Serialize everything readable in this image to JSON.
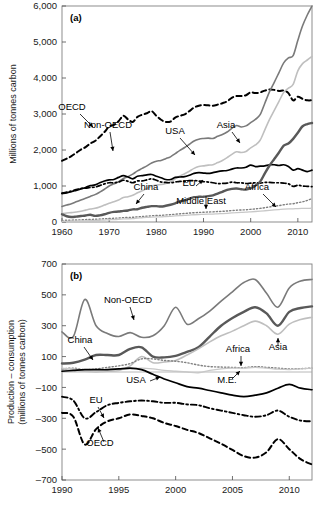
{
  "figure": {
    "panels": [
      "a",
      "b"
    ]
  },
  "chart_data": [
    {
      "id": "panel-a",
      "type": "line",
      "panel_tag": "(a)",
      "title": "",
      "xlabel": "",
      "ylabel": "Millions of tonnes carbon",
      "xlim": [
        1960,
        2013
      ],
      "ylim": [
        0,
        6000
      ],
      "xticks": [
        1960,
        1970,
        1980,
        1990,
        2000,
        2010
      ],
      "yticks": [
        0,
        1000,
        2000,
        3000,
        4000,
        5000,
        6000
      ],
      "ytick_labels": [
        "0",
        "1,000",
        "2,000",
        "3,000",
        "4,000",
        "5,000",
        "6,000"
      ],
      "xtick_labels": [
        "1960",
        "1970",
        "1980",
        "1990",
        "2000",
        "2010"
      ],
      "grid": false,
      "legend": "inline-annotations",
      "x": [
        1960,
        1961,
        1962,
        1963,
        1964,
        1965,
        1966,
        1967,
        1968,
        1969,
        1970,
        1971,
        1972,
        1973,
        1974,
        1975,
        1976,
        1977,
        1978,
        1979,
        1980,
        1981,
        1982,
        1983,
        1984,
        1985,
        1986,
        1987,
        1988,
        1989,
        1990,
        1991,
        1992,
        1993,
        1994,
        1995,
        1996,
        1997,
        1998,
        1999,
        2000,
        2001,
        2002,
        2003,
        2004,
        2005,
        2006,
        2007,
        2008,
        2009,
        2010,
        2011,
        2012,
        2013
      ],
      "series": [
        {
          "name": "OECD",
          "style": "dashed",
          "color": "#000000",
          "width": 2.0,
          "values": [
            1700,
            1760,
            1830,
            1920,
            2010,
            2080,
            2180,
            2250,
            2370,
            2500,
            2650,
            2700,
            2800,
            2950,
            2850,
            2780,
            2920,
            2980,
            3020,
            3080,
            2950,
            2840,
            2780,
            2790,
            2900,
            2950,
            2990,
            3080,
            3180,
            3230,
            3250,
            3240,
            3230,
            3260,
            3300,
            3350,
            3450,
            3500,
            3500,
            3520,
            3600,
            3580,
            3600,
            3650,
            3680,
            3670,
            3640,
            3650,
            3580,
            3380,
            3480,
            3420,
            3380,
            3380
          ]
        },
        {
          "name": "Non-OECD",
          "style": "solid",
          "color": "#7a7a7a",
          "width": 1.6,
          "values": [
            430,
            470,
            510,
            560,
            610,
            660,
            710,
            760,
            830,
            910,
            1000,
            1060,
            1120,
            1210,
            1260,
            1330,
            1420,
            1490,
            1560,
            1640,
            1690,
            1710,
            1760,
            1810,
            1900,
            1990,
            2070,
            2160,
            2250,
            2300,
            2320,
            2330,
            2320,
            2380,
            2430,
            2500,
            2600,
            2680,
            2640,
            2670,
            2760,
            2850,
            2980,
            3300,
            3620,
            3880,
            4150,
            4420,
            4560,
            4620,
            5050,
            5450,
            5750,
            6000
          ]
        },
        {
          "name": "Asia",
          "style": "solid",
          "color": "#bfbfbf",
          "width": 1.6,
          "values": [
            230,
            250,
            260,
            280,
            300,
            330,
            360,
            380,
            420,
            470,
            520,
            560,
            610,
            680,
            700,
            740,
            810,
            870,
            930,
            1000,
            1030,
            1040,
            1070,
            1120,
            1200,
            1280,
            1340,
            1410,
            1490,
            1540,
            1560,
            1580,
            1590,
            1650,
            1710,
            1790,
            1880,
            1950,
            1930,
            1960,
            2060,
            2140,
            2270,
            2560,
            2850,
            3100,
            3350,
            3600,
            3720,
            3820,
            4200,
            4400,
            4500,
            4600
          ]
        },
        {
          "name": "USA",
          "style": "solid",
          "color": "#000000",
          "width": 1.7,
          "values": [
            790,
            810,
            840,
            880,
            920,
            960,
            1010,
            1030,
            1090,
            1140,
            1170,
            1180,
            1240,
            1290,
            1250,
            1200,
            1270,
            1290,
            1310,
            1320,
            1270,
            1230,
            1180,
            1180,
            1240,
            1250,
            1260,
            1300,
            1350,
            1370,
            1360,
            1350,
            1370,
            1400,
            1420,
            1430,
            1470,
            1500,
            1500,
            1520,
            1580,
            1540,
            1550,
            1560,
            1590,
            1590,
            1570,
            1590,
            1540,
            1440,
            1480,
            1440,
            1400,
            1440
          ]
        },
        {
          "name": "EU",
          "style": "dashdot",
          "color": "#000000",
          "width": 1.7,
          "values": [
            800,
            830,
            860,
            900,
            930,
            940,
            960,
            970,
            1010,
            1060,
            1090,
            1090,
            1110,
            1160,
            1130,
            1090,
            1140,
            1140,
            1170,
            1200,
            1160,
            1110,
            1100,
            1090,
            1110,
            1130,
            1130,
            1150,
            1150,
            1140,
            1120,
            1110,
            1090,
            1070,
            1070,
            1080,
            1110,
            1090,
            1090,
            1070,
            1080,
            1090,
            1080,
            1100,
            1100,
            1090,
            1090,
            1080,
            1060,
            990,
            1020,
            1000,
            990,
            980
          ]
        },
        {
          "name": "China",
          "style": "solid",
          "color": "#595959",
          "width": 2.4,
          "values": [
            215,
            160,
            140,
            150,
            165,
            180,
            200,
            170,
            185,
            215,
            255,
            280,
            290,
            310,
            320,
            350,
            355,
            395,
            420,
            440,
            440,
            430,
            450,
            480,
            520,
            570,
            600,
            650,
            690,
            700,
            700,
            720,
            740,
            790,
            840,
            890,
            920,
            930,
            910,
            900,
            940,
            1010,
            1120,
            1350,
            1570,
            1750,
            1930,
            2120,
            2180,
            2310,
            2480,
            2660,
            2720,
            2750
          ]
        },
        {
          "name": "Africa",
          "style": "dotted",
          "color": "#808080",
          "width": 1.4,
          "values": [
            45,
            48,
            52,
            56,
            60,
            66,
            72,
            76,
            82,
            90,
            98,
            104,
            112,
            122,
            128,
            132,
            142,
            152,
            162,
            174,
            182,
            186,
            196,
            204,
            216,
            228,
            236,
            248,
            258,
            266,
            272,
            278,
            282,
            290,
            296,
            306,
            318,
            328,
            334,
            340,
            352,
            364,
            378,
            398,
            418,
            438,
            456,
            478,
            498,
            508,
            536,
            562,
            600,
            650
          ]
        },
        {
          "name": "Middle East",
          "style": "solid",
          "color": "#c8c8c8",
          "width": 1.3,
          "values": [
            18,
            20,
            22,
            26,
            30,
            34,
            38,
            42,
            48,
            54,
            62,
            68,
            76,
            86,
            90,
            96,
            108,
            118,
            126,
            134,
            140,
            142,
            150,
            158,
            168,
            176,
            182,
            192,
            202,
            208,
            212,
            216,
            220,
            228,
            234,
            242,
            252,
            260,
            266,
            272,
            282,
            292,
            302,
            312,
            324,
            336,
            346,
            356,
            362,
            366,
            374,
            378,
            380,
            382
          ]
        }
      ]
    },
    {
      "id": "panel-b",
      "type": "line",
      "panel_tag": "(b)",
      "title": "",
      "xlabel": "",
      "ylabel": "Production – consumption (millions of tonnes carbon)",
      "xlim": [
        1990,
        2012
      ],
      "ylim": [
        -700,
        700
      ],
      "xticks": [
        1990,
        1995,
        2000,
        2005,
        2010
      ],
      "yticks": [
        -700,
        -500,
        -300,
        -100,
        100,
        300,
        500,
        700
      ],
      "ytick_labels": [
        "–700",
        "–500",
        "–300",
        "–100",
        "100",
        "300",
        "500",
        "700"
      ],
      "xtick_labels": [
        "1990",
        "1995",
        "2000",
        "2005",
        "2010"
      ],
      "grid": false,
      "legend": "inline-annotations",
      "x": [
        1990,
        1991,
        1992,
        1993,
        1994,
        1995,
        1996,
        1997,
        1998,
        1999,
        2000,
        2001,
        2002,
        2003,
        2004,
        2005,
        2006,
        2007,
        2008,
        2009,
        2010,
        2011,
        2012
      ],
      "series": [
        {
          "name": "Non-OECD",
          "style": "solid",
          "color": "#7a7a7a",
          "width": 1.6,
          "values": [
            260,
            230,
            470,
            300,
            250,
            230,
            255,
            225,
            235,
            300,
            420,
            310,
            345,
            395,
            460,
            520,
            580,
            600,
            510,
            420,
            545,
            590,
            600
          ]
        },
        {
          "name": "China",
          "style": "solid",
          "color": "#595959",
          "width": 2.4,
          "values": [
            55,
            60,
            80,
            110,
            110,
            110,
            150,
            160,
            100,
            95,
            105,
            130,
            160,
            230,
            300,
            350,
            390,
            420,
            380,
            300,
            390,
            415,
            425
          ]
        },
        {
          "name": "Asia",
          "style": "solid",
          "color": "#bfbfbf",
          "width": 1.6,
          "values": [
            15,
            10,
            5,
            0,
            5,
            10,
            40,
            100,
            60,
            65,
            75,
            110,
            150,
            195,
            235,
            265,
            300,
            330,
            300,
            245,
            310,
            340,
            355
          ]
        },
        {
          "name": "Africa",
          "style": "dotted",
          "color": "#808080",
          "width": 1.4,
          "values": [
            20,
            25,
            15,
            20,
            30,
            40,
            55,
            85,
            85,
            75,
            70,
            60,
            45,
            35,
            32,
            30,
            28,
            35,
            30,
            25,
            20,
            22,
            25
          ]
        },
        {
          "name": "M.E.",
          "style": "solid",
          "color": "#c8c8c8",
          "width": 1.3,
          "values": [
            25,
            20,
            10,
            5,
            10,
            15,
            20,
            25,
            20,
            10,
            5,
            0,
            -5,
            10,
            20,
            25,
            25,
            30,
            25,
            18,
            15,
            20,
            25
          ]
        },
        {
          "name": "USA",
          "style": "solid",
          "color": "#000000",
          "width": 1.7,
          "values": [
            5,
            10,
            15,
            15,
            15,
            20,
            25,
            15,
            -15,
            -45,
            -70,
            -95,
            -105,
            -120,
            -135,
            -150,
            -160,
            -150,
            -135,
            -105,
            -80,
            -105,
            -115
          ]
        },
        {
          "name": "EU",
          "style": "dashdot",
          "color": "#000000",
          "width": 1.9,
          "values": [
            -160,
            -185,
            -300,
            -260,
            -215,
            -200,
            -190,
            -185,
            -190,
            -200,
            -200,
            -210,
            -215,
            -235,
            -250,
            -265,
            -280,
            -290,
            -280,
            -250,
            -290,
            -315,
            -320
          ]
        },
        {
          "name": "OECD",
          "style": "dashed",
          "color": "#000000",
          "width": 2.0,
          "values": [
            -265,
            -290,
            -470,
            -370,
            -320,
            -300,
            -275,
            -285,
            -300,
            -330,
            -350,
            -375,
            -395,
            -430,
            -465,
            -505,
            -545,
            -555,
            -520,
            -435,
            -500,
            -565,
            -600
          ]
        }
      ]
    }
  ],
  "annotations": {
    "panel_a": [
      {
        "label": "OECD",
        "x": 72,
        "y": 110
      },
      {
        "label": "Non-OECD",
        "x": 108,
        "y": 128
      },
      {
        "label": "Asia",
        "x": 226,
        "y": 128
      },
      {
        "label": "USA",
        "x": 175,
        "y": 134
      },
      {
        "label": "China",
        "x": 146,
        "y": 190
      },
      {
        "label": "EU",
        "x": 189,
        "y": 186
      },
      {
        "label": "Middle East",
        "x": 201,
        "y": 204
      },
      {
        "label": "Africa",
        "x": 257,
        "y": 190
      }
    ],
    "panel_b": [
      {
        "label": "Non-OECD",
        "x": 128,
        "y": 303
      },
      {
        "label": "China",
        "x": 80,
        "y": 343
      },
      {
        "label": "Asia",
        "x": 278,
        "y": 350
      },
      {
        "label": "Africa",
        "x": 238,
        "y": 352
      },
      {
        "label": "M.E.",
        "x": 227,
        "y": 383
      },
      {
        "label": "USA",
        "x": 136,
        "y": 383
      },
      {
        "label": "EU",
        "x": 96,
        "y": 403
      },
      {
        "label": "OECD",
        "x": 100,
        "y": 446
      }
    ]
  }
}
